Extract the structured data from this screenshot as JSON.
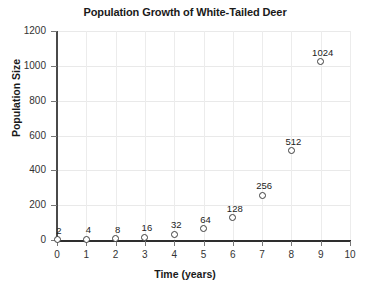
{
  "chart_data": {
    "type": "scatter",
    "title": "Population Growth of White-Tailed Deer",
    "xlabel": "Time (years)",
    "ylabel": "Population Size",
    "xlim": [
      0,
      10
    ],
    "ylim": [
      0,
      1200
    ],
    "grid": true,
    "legend": "none",
    "x": [
      0,
      1,
      2,
      3,
      4,
      5,
      6,
      7,
      8,
      9
    ],
    "values": [
      2,
      4,
      8,
      16,
      32,
      64,
      128,
      256,
      512,
      1024
    ],
    "point_labels": [
      "2",
      "4",
      "8",
      "16",
      "32",
      "64",
      "128",
      "256",
      "512",
      "1024"
    ],
    "x_ticks": [
      "0",
      "1",
      "2",
      "3",
      "4",
      "5",
      "6",
      "7",
      "8",
      "9",
      "10"
    ],
    "y_ticks": [
      "0",
      "200",
      "400",
      "600",
      "800",
      "1000",
      "1200"
    ],
    "marker_style": "open-circle",
    "marker_color": "#3d3d3d",
    "grid_color": "#e9e9e9",
    "axis_color": "#2e2e2e",
    "background": "#ffffff"
  }
}
